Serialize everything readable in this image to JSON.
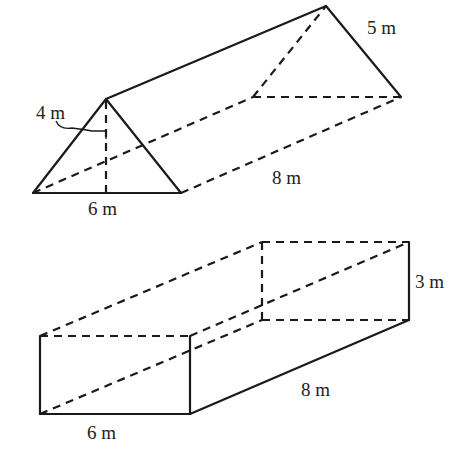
{
  "figures": [
    {
      "name": "triangular-prism",
      "labels": {
        "height": "4 m",
        "base": "6 m",
        "slant_side": "5 m",
        "length": "8 m"
      }
    },
    {
      "name": "rectangular-prism",
      "labels": {
        "height": "3 m",
        "width": "6 m",
        "length": "8 m"
      }
    }
  ],
  "colors": {
    "stroke": "#1a1a1a",
    "text": "#222222",
    "background": "#ffffff"
  }
}
